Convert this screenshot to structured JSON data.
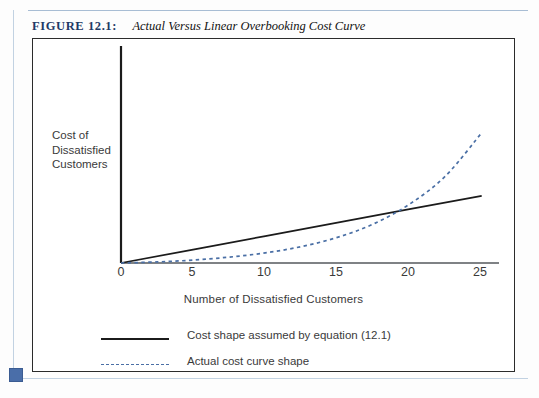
{
  "caption": {
    "label": "FIGURE 12.1:",
    "title": "Actual Versus Linear Overbooking Cost Curve"
  },
  "colors": {
    "caption_label": "#1f3a66",
    "frame": "#2b2b2b",
    "axis": "#1b1b1b",
    "linear_series": "#1b1b1b",
    "actual_series": "#4a6fa5",
    "page_rule": "#a8bdd4",
    "corner_marker": "#4a6ea9"
  },
  "chart_data": {
    "type": "line",
    "title": "Actual Versus Linear Overbooking Cost Curve",
    "xlabel": "Number of Dissatisfied Customers",
    "ylabel": "Cost of Dissatisfied Customers",
    "ylabel_lines": [
      "Cost of",
      "Dissatisfied",
      "Customers"
    ],
    "xlim": [
      0,
      26.2
    ],
    "ylim": [
      0,
      100
    ],
    "xticks": [
      0,
      5,
      10,
      15,
      20,
      25
    ],
    "xtick_labels": [
      "0",
      "5",
      "10",
      "15",
      "20",
      "25"
    ],
    "yticks": [],
    "ytick_labels": [],
    "grid": false,
    "legend_position": "below-axes",
    "series": [
      {
        "name": "Cost shape assumed by equation (12.1)",
        "style": "solid",
        "color": "#1b1b1b",
        "x": [
          0,
          5,
          10,
          15,
          20,
          25
        ],
        "values": [
          0,
          6.4,
          12.8,
          19.2,
          25.6,
          32.0
        ]
      },
      {
        "name": "Actual cost curve shape",
        "style": "dashed",
        "color": "#4a6fa5",
        "x": [
          0,
          2.5,
          5,
          7.5,
          10,
          12.5,
          15,
          17.5,
          20,
          22.5,
          25
        ],
        "values": [
          0,
          0.5,
          1.4,
          2.8,
          4.8,
          7.8,
          12.2,
          18.6,
          28.0,
          41.5,
          62.0
        ]
      }
    ],
    "annotations": [
      {
        "text": "curves intersect near x = 18",
        "x": 18,
        "y": 23
      }
    ]
  },
  "legend": {
    "items": [
      {
        "label": "Cost shape assumed by equation (12.1)",
        "style": "solid"
      },
      {
        "label": "Actual cost curve shape",
        "style": "dashed"
      }
    ]
  }
}
